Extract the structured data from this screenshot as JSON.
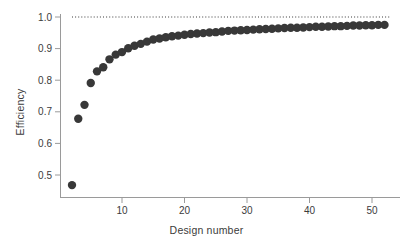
{
  "chart_data": {
    "type": "scatter",
    "title": "",
    "xlabel": "Design number",
    "ylabel": "Efficiency",
    "xlim": [
      1,
      53
    ],
    "ylim": [
      0.44,
      1.02
    ],
    "xticks": [
      10,
      20,
      30,
      40,
      50
    ],
    "xtick_labels": [
      "10",
      "20",
      "30",
      "40",
      "50"
    ],
    "yticks": [
      0.5,
      0.6,
      0.7,
      0.8,
      0.9,
      1.0
    ],
    "ytick_labels": [
      "0.5",
      "0.6",
      "0.7",
      "0.8",
      "0.9",
      "1.0"
    ],
    "grid": false,
    "legend": "none",
    "marker": "filled-circle",
    "marker_color": "#383838",
    "marker_size": 4.2,
    "reference_line": {
      "type": "horizontal-dotted",
      "y": 1.0,
      "label": "",
      "color": "#3b3b3b",
      "x_start": 2,
      "x_end": 53
    },
    "x": [
      2,
      3,
      4,
      5,
      6,
      7,
      8,
      9,
      10,
      11,
      12,
      13,
      14,
      15,
      16,
      17,
      18,
      19,
      20,
      21,
      22,
      23,
      24,
      25,
      26,
      27,
      28,
      29,
      30,
      31,
      32,
      33,
      34,
      35,
      36,
      37,
      38,
      39,
      40,
      41,
      42,
      43,
      44,
      45,
      46,
      47,
      48,
      49,
      50,
      51,
      52
    ],
    "values": [
      0.468,
      0.678,
      0.722,
      0.791,
      0.828,
      0.841,
      0.866,
      0.881,
      0.889,
      0.901,
      0.909,
      0.915,
      0.922,
      0.929,
      0.932,
      0.936,
      0.939,
      0.941,
      0.944,
      0.946,
      0.948,
      0.949,
      0.951,
      0.952,
      0.954,
      0.956,
      0.957,
      0.958,
      0.959,
      0.96,
      0.961,
      0.962,
      0.963,
      0.964,
      0.965,
      0.966,
      0.966,
      0.967,
      0.968,
      0.969,
      0.969,
      0.97,
      0.971,
      0.971,
      0.972,
      0.973,
      0.973,
      0.974,
      0.974,
      0.975,
      0.975
    ],
    "series": [
      {
        "name": "Efficiency",
        "values": [
          0.468,
          0.678,
          0.722,
          0.791,
          0.828,
          0.841,
          0.866,
          0.881,
          0.889,
          0.901,
          0.909,
          0.915,
          0.922,
          0.929,
          0.932,
          0.936,
          0.939,
          0.941,
          0.944,
          0.946,
          0.948,
          0.949,
          0.951,
          0.952,
          0.954,
          0.956,
          0.957,
          0.958,
          0.959,
          0.96,
          0.961,
          0.962,
          0.963,
          0.964,
          0.965,
          0.966,
          0.966,
          0.967,
          0.968,
          0.969,
          0.969,
          0.97,
          0.971,
          0.971,
          0.972,
          0.973,
          0.973,
          0.974,
          0.974,
          0.975,
          0.975
        ]
      }
    ]
  },
  "axes": {
    "x_title": "Design number",
    "y_title": "Efficiency"
  },
  "colors": {
    "marker": "#383838",
    "axis": "#9a9a9a",
    "text": "#3b3b3b",
    "background": "#ffffff"
  }
}
